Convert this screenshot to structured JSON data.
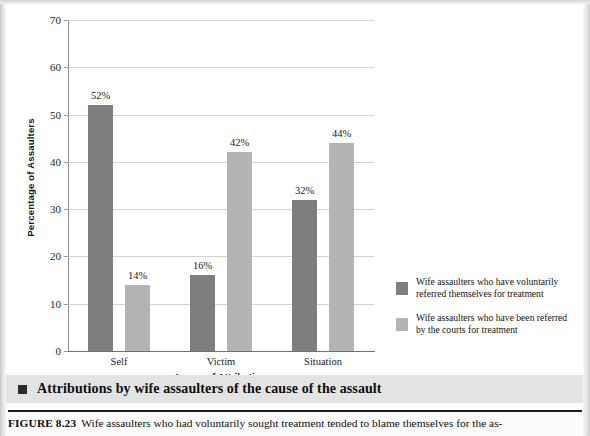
{
  "figure": {
    "section_title": "Attributions by wife assaulters of the cause of the assault",
    "caption_label": "FIGURE 8.23",
    "caption_text": "Wife assaulters who had voluntarily sought treatment tended to blame themselves for the as-"
  },
  "chart_data": {
    "type": "bar",
    "title": "",
    "xlabel": "Locus of Attribution",
    "ylabel": "Percentage of Assaulters",
    "categories": [
      "Self",
      "Victim",
      "Situation"
    ],
    "ylim": [
      0,
      70
    ],
    "yticks": [
      0,
      10,
      20,
      30,
      40,
      50,
      60,
      70
    ],
    "ytick_labels": [
      "0",
      "10",
      "20",
      "30",
      "40",
      "50",
      "60",
      "70"
    ],
    "grid": true,
    "legend_position": "right",
    "series": [
      {
        "name": "Wife assaulters who have voluntarily referred themselves for treatment",
        "short_name": "voluntary-referral",
        "color": "#7e7e7e",
        "values": [
          52,
          16,
          32
        ],
        "labels": [
          "52%",
          "16%",
          "32%"
        ]
      },
      {
        "name": "Wife assaulters who have been referred by the courts for treatment",
        "short_name": "court-referral",
        "color": "#b4b4b4",
        "values": [
          14,
          42,
          44
        ],
        "labels": [
          "14%",
          "42%",
          "44%"
        ]
      }
    ],
    "legend": [
      {
        "color": "#7e7e7e",
        "line1": "Wife assaulters who have voluntarily",
        "line2": "referred themselves for treatment"
      },
      {
        "color": "#b4b4b4",
        "line1": "Wife assaulters who have been referred",
        "line2": "by the courts for treatment"
      }
    ]
  }
}
